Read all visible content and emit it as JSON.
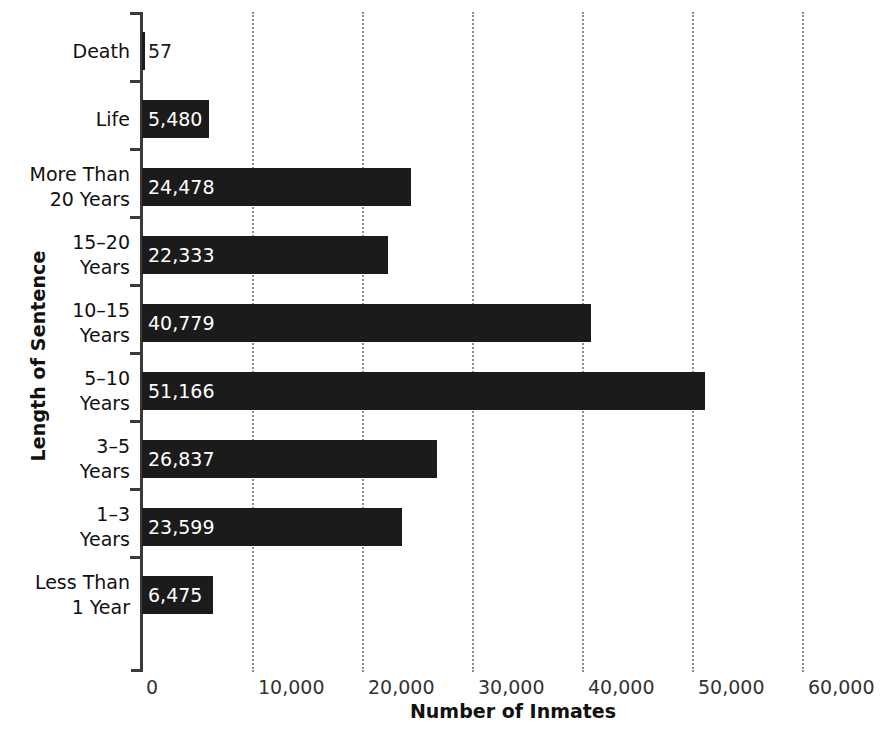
{
  "chart_data": {
    "type": "bar",
    "orientation": "horizontal",
    "title": "",
    "xlabel": "Number of Inmates",
    "ylabel": "Length of Sentence",
    "xlim": [
      0,
      60000
    ],
    "xticks": [
      "0",
      "10,000",
      "20,000",
      "30,000",
      "40,000",
      "50,000",
      "60,000"
    ],
    "xtick_values": [
      0,
      10000,
      20000,
      30000,
      40000,
      50000,
      60000
    ],
    "grid": "vertical-dotted",
    "legend": "none",
    "bar_color": "#1b1b1b",
    "categories": [
      "Death",
      "Life",
      "More Than 20 Years",
      "15–20 Years",
      "10–15 Years",
      "5–10 Years",
      "3–5 Years",
      "1–3 Years",
      "Less Than 1 Year"
    ],
    "values": [
      57,
      5480,
      24478,
      22333,
      40779,
      51166,
      26837,
      23599,
      6475
    ],
    "value_labels": [
      "57",
      "5,480",
      "24,478",
      "22,333",
      "40,779",
      "51,166",
      "26,837",
      "23,599",
      "6,475"
    ]
  },
  "axes": {
    "y_title": "Length of Sentence",
    "x_title": "Number of Inmates"
  },
  "category_lines": [
    [
      "Death"
    ],
    [
      "Life"
    ],
    [
      "More Than",
      "20 Years"
    ],
    [
      "15–20",
      "Years"
    ],
    [
      "10–15",
      "Years"
    ],
    [
      "5–10",
      "Years"
    ],
    [
      "3–5",
      "Years"
    ],
    [
      "1–3",
      "Years"
    ],
    [
      "Less Than",
      "1 Year"
    ]
  ]
}
